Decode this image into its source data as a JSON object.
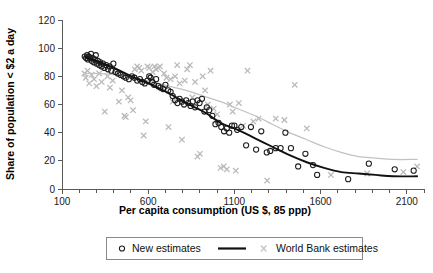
{
  "chart_data": {
    "type": "scatter",
    "title": "",
    "xlabel": "Per capita consumption (US $, 85 ppp)",
    "ylabel": "Share of population < $2 a day",
    "xlim": [
      100,
      2200
    ],
    "ylim": [
      0,
      120
    ],
    "grid": false,
    "xticks": [
      100,
      600,
      1100,
      1600,
      2100
    ],
    "xtick_labels": [
      "100",
      "600",
      "1100",
      "1600",
      "2100"
    ],
    "yticks": [
      0,
      20,
      40,
      60,
      80,
      100,
      120
    ],
    "ytick_labels": [
      "0",
      "20",
      "40",
      "60",
      "80",
      "100",
      "120"
    ],
    "x_minor_tick_step": 100,
    "legend_position": "below-axes",
    "series": [
      {
        "name": "New estimates",
        "marker": "open-circle",
        "color": "#1c1c1c",
        "has_fit_line": true,
        "fit_line_color": "#111111",
        "points": [
          [
            232,
            94
          ],
          [
            240,
            93
          ],
          [
            246,
            95
          ],
          [
            250,
            92
          ],
          [
            256,
            94
          ],
          [
            262,
            93
          ],
          [
            268,
            96
          ],
          [
            272,
            91
          ],
          [
            278,
            93
          ],
          [
            284,
            90
          ],
          [
            290,
            92
          ],
          [
            296,
            95
          ],
          [
            302,
            89
          ],
          [
            308,
            91
          ],
          [
            316,
            88
          ],
          [
            322,
            90
          ],
          [
            330,
            87
          ],
          [
            338,
            89
          ],
          [
            346,
            86
          ],
          [
            356,
            88
          ],
          [
            366,
            85
          ],
          [
            376,
            87
          ],
          [
            386,
            84
          ],
          [
            398,
            89
          ],
          [
            410,
            83
          ],
          [
            424,
            82
          ],
          [
            440,
            81
          ],
          [
            456,
            80
          ],
          [
            470,
            79
          ],
          [
            488,
            78
          ],
          [
            506,
            80
          ],
          [
            520,
            79
          ],
          [
            536,
            77
          ],
          [
            552,
            78
          ],
          [
            566,
            76
          ],
          [
            580,
            75
          ],
          [
            596,
            77
          ],
          [
            606,
            80
          ],
          [
            614,
            79
          ],
          [
            624,
            76
          ],
          [
            634,
            74
          ],
          [
            646,
            78
          ],
          [
            658,
            73
          ],
          [
            670,
            72
          ],
          [
            686,
            71
          ],
          [
            700,
            74
          ],
          [
            716,
            70
          ],
          [
            730,
            69
          ],
          [
            742,
            66
          ],
          [
            756,
            63
          ],
          [
            770,
            61
          ],
          [
            782,
            64
          ],
          [
            796,
            62
          ],
          [
            808,
            60
          ],
          [
            820,
            63
          ],
          [
            832,
            61
          ],
          [
            846,
            59
          ],
          [
            858,
            62
          ],
          [
            872,
            58
          ],
          [
            886,
            63
          ],
          [
            898,
            61
          ],
          [
            912,
            64
          ],
          [
            926,
            55
          ],
          [
            940,
            58
          ],
          [
            954,
            56
          ],
          [
            972,
            52
          ],
          [
            990,
            46
          ],
          [
            1008,
            47
          ],
          [
            1024,
            44
          ],
          [
            1040,
            41
          ],
          [
            1056,
            43
          ],
          [
            1070,
            40
          ],
          [
            1086,
            45
          ],
          [
            1100,
            45
          ],
          [
            1116,
            42
          ],
          [
            1140,
            44
          ],
          [
            1168,
            31
          ],
          [
            1196,
            44
          ],
          [
            1226,
            28
          ],
          [
            1256,
            41
          ],
          [
            1288,
            26
          ],
          [
            1308,
            27
          ],
          [
            1340,
            29
          ],
          [
            1368,
            29
          ],
          [
            1396,
            40
          ],
          [
            1428,
            29
          ],
          [
            1470,
            16
          ],
          [
            1512,
            25
          ],
          [
            1556,
            17
          ],
          [
            1580,
            10
          ],
          [
            1760,
            7
          ],
          [
            1880,
            18
          ],
          [
            2030,
            14
          ],
          [
            2140,
            13
          ]
        ]
      },
      {
        "name": "World Bank estimates",
        "marker": "cross-x",
        "color": "#b9b9b9",
        "has_fit_line": true,
        "fit_line_color": "#c2c2c2",
        "points": [
          [
            230,
            82
          ],
          [
            238,
            79
          ],
          [
            248,
            84
          ],
          [
            258,
            75
          ],
          [
            272,
            81
          ],
          [
            286,
            78
          ],
          [
            300,
            73
          ],
          [
            316,
            82
          ],
          [
            330,
            76
          ],
          [
            348,
            55
          ],
          [
            364,
            80
          ],
          [
            378,
            72
          ],
          [
            394,
            77
          ],
          [
            412,
            83
          ],
          [
            430,
            62
          ],
          [
            448,
            70
          ],
          [
            462,
            52
          ],
          [
            470,
            51
          ],
          [
            484,
            65
          ],
          [
            498,
            63
          ],
          [
            512,
            56
          ],
          [
            522,
            85
          ],
          [
            536,
            87
          ],
          [
            548,
            86
          ],
          [
            560,
            84
          ],
          [
            574,
            38
          ],
          [
            586,
            48
          ],
          [
            596,
            87
          ],
          [
            606,
            86
          ],
          [
            614,
            78
          ],
          [
            626,
            83
          ],
          [
            636,
            87
          ],
          [
            646,
            85
          ],
          [
            658,
            86
          ],
          [
            668,
            87
          ],
          [
            680,
            72
          ],
          [
            692,
            82
          ],
          [
            706,
            79
          ],
          [
            718,
            44
          ],
          [
            730,
            78
          ],
          [
            742,
            62
          ],
          [
            756,
            80
          ],
          [
            768,
            88
          ],
          [
            782,
            75
          ],
          [
            796,
            35
          ],
          [
            812,
            77
          ],
          [
            826,
            85
          ],
          [
            842,
            88
          ],
          [
            856,
            65
          ],
          [
            872,
            76
          ],
          [
            886,
            23
          ],
          [
            900,
            25
          ],
          [
            916,
            80
          ],
          [
            930,
            70
          ],
          [
            946,
            60
          ],
          [
            962,
            84
          ],
          [
            980,
            57
          ],
          [
            1000,
            53
          ],
          [
            1020,
            15
          ],
          [
            1038,
            16
          ],
          [
            1056,
            14
          ],
          [
            1074,
            60
          ],
          [
            1090,
            55
          ],
          [
            1108,
            13
          ],
          [
            1126,
            61
          ],
          [
            1150,
            45
          ],
          [
            1176,
            84
          ],
          [
            1210,
            48
          ],
          [
            1240,
            50
          ],
          [
            1290,
            6
          ],
          [
            1340,
            50
          ],
          [
            1390,
            49
          ],
          [
            1450,
            74
          ],
          [
            1520,
            43
          ],
          [
            1660,
            10
          ],
          [
            1870,
            11
          ],
          [
            2080,
            12
          ],
          [
            2160,
            16
          ]
        ]
      }
    ],
    "fit_curves": [
      {
        "name": "New estimates fit",
        "color": "#111111",
        "points": [
          [
            232,
            94
          ],
          [
            320,
            90
          ],
          [
            420,
            85
          ],
          [
            520,
            79
          ],
          [
            620,
            74
          ],
          [
            720,
            68
          ],
          [
            820,
            61
          ],
          [
            920,
            55
          ],
          [
            1020,
            47
          ],
          [
            1120,
            42
          ],
          [
            1220,
            36
          ],
          [
            1320,
            30
          ],
          [
            1420,
            24
          ],
          [
            1520,
            19
          ],
          [
            1620,
            15
          ],
          [
            1720,
            12
          ],
          [
            1820,
            11
          ],
          [
            1920,
            10
          ],
          [
            2020,
            9
          ],
          [
            2160,
            9
          ]
        ]
      },
      {
        "name": "World Bank estimates fit",
        "color": "#c2c2c2",
        "points": [
          [
            232,
            82
          ],
          [
            320,
            82
          ],
          [
            420,
            81
          ],
          [
            520,
            79
          ],
          [
            620,
            76
          ],
          [
            720,
            73
          ],
          [
            820,
            70
          ],
          [
            920,
            66
          ],
          [
            1020,
            62
          ],
          [
            1120,
            57
          ],
          [
            1220,
            52
          ],
          [
            1320,
            46
          ],
          [
            1420,
            40
          ],
          [
            1520,
            35
          ],
          [
            1620,
            30
          ],
          [
            1720,
            26
          ],
          [
            1820,
            23
          ],
          [
            1920,
            22
          ],
          [
            2020,
            21
          ],
          [
            2160,
            21
          ]
        ]
      }
    ]
  },
  "legend": {
    "entries": [
      {
        "label": "New estimates",
        "marker": "open-circle"
      },
      {
        "label": "",
        "marker": "black-line"
      },
      {
        "label": "World Bank estimates",
        "marker": "cross-x"
      }
    ]
  },
  "colors": {
    "new_estimates": "#1c1c1c",
    "world_bank": "#b9b9b9",
    "axis": "#5a5a5a",
    "background": "#ffffff"
  }
}
